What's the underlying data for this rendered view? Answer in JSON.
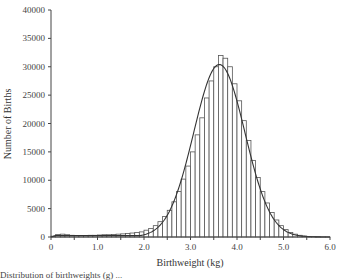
{
  "chart_data": {
    "type": "bar",
    "title": "",
    "xlabel": "Birthweight (kg)",
    "ylabel": "Number of Births",
    "xlim": [
      0,
      6.0
    ],
    "ylim": [
      0,
      40000
    ],
    "grid": false,
    "bin_width": 0.1,
    "x_ticks": [
      "0",
      "1.0",
      "2.0",
      "3.0",
      "4.0",
      "5.0",
      "6.0"
    ],
    "y_ticks": [
      "0",
      "5000",
      "10000",
      "15000",
      "20000",
      "25000",
      "30000",
      "35000",
      "40000"
    ],
    "bins_start": [
      0.0,
      0.1,
      0.2,
      0.3,
      0.4,
      0.5,
      0.6,
      0.7,
      0.8,
      0.9,
      1.0,
      1.1,
      1.2,
      1.3,
      1.4,
      1.5,
      1.6,
      1.7,
      1.8,
      1.9,
      2.0,
      2.1,
      2.2,
      2.3,
      2.4,
      2.5,
      2.6,
      2.7,
      2.8,
      2.9,
      3.0,
      3.1,
      3.2,
      3.3,
      3.4,
      3.5,
      3.6,
      3.7,
      3.8,
      3.9,
      4.0,
      4.1,
      4.2,
      4.3,
      4.4,
      4.5,
      4.6,
      4.7,
      4.8,
      4.9,
      5.0,
      5.1,
      5.2,
      5.3,
      5.4,
      5.5,
      5.6,
      5.7,
      5.8,
      5.9
    ],
    "values": [
      150,
      450,
      500,
      400,
      300,
      250,
      250,
      250,
      300,
      300,
      350,
      400,
      400,
      450,
      500,
      550,
      600,
      700,
      800,
      900,
      1200,
      1500,
      2000,
      2700,
      3600,
      4700,
      6200,
      8000,
      10200,
      12500,
      15000,
      18000,
      21000,
      24500,
      27500,
      30000,
      32000,
      31500,
      30000,
      27000,
      24000,
      20500,
      17000,
      13500,
      10500,
      8000,
      6000,
      4300,
      3000,
      2000,
      1300,
      800,
      500,
      300,
      180,
      100,
      60,
      30,
      20,
      10
    ],
    "curve": {
      "label": "Fitted normal curve",
      "mean": 3.62,
      "sd": 0.55,
      "peak": 30400,
      "residual_level": 250
    }
  },
  "caption": "Distribution of birthweights (g) ..."
}
